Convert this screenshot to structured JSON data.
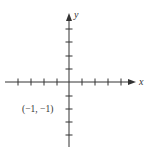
{
  "diagram": {
    "type": "coordinate-plane",
    "axes": {
      "x_label": "x",
      "y_label": "y",
      "x_ticks_negative": 4,
      "x_ticks_positive": 4,
      "y_ticks_positive": 4,
      "y_ticks_negative": 4
    },
    "point_label": "(−1, −1)",
    "colors": {
      "axis": "#333333",
      "background": "#ffffff"
    }
  }
}
